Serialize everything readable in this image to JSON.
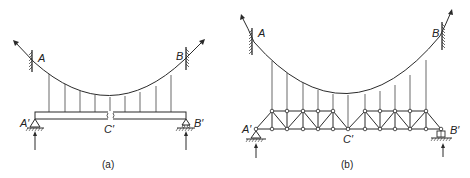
{
  "figure_a": {
    "caption": "(a)",
    "labels": {
      "A": "A",
      "B": "B",
      "A_prime": "A′",
      "B_prime": "B′",
      "C_prime": "C′"
    },
    "description": "Suspension cable A–B with hangers supporting a stiffening girder A′–B′ hinged at C′"
  },
  "figure_b": {
    "caption": "(b)",
    "labels": {
      "A": "A",
      "B": "B",
      "A_prime": "A′",
      "B_prime": "B′",
      "C_prime": "C′"
    },
    "description": "Suspension cable A–B with hangers supporting a stiffening truss A′–B′ hinged at C′"
  },
  "colors": {
    "ink": "#2a2a2a",
    "background": "#ffffff"
  }
}
